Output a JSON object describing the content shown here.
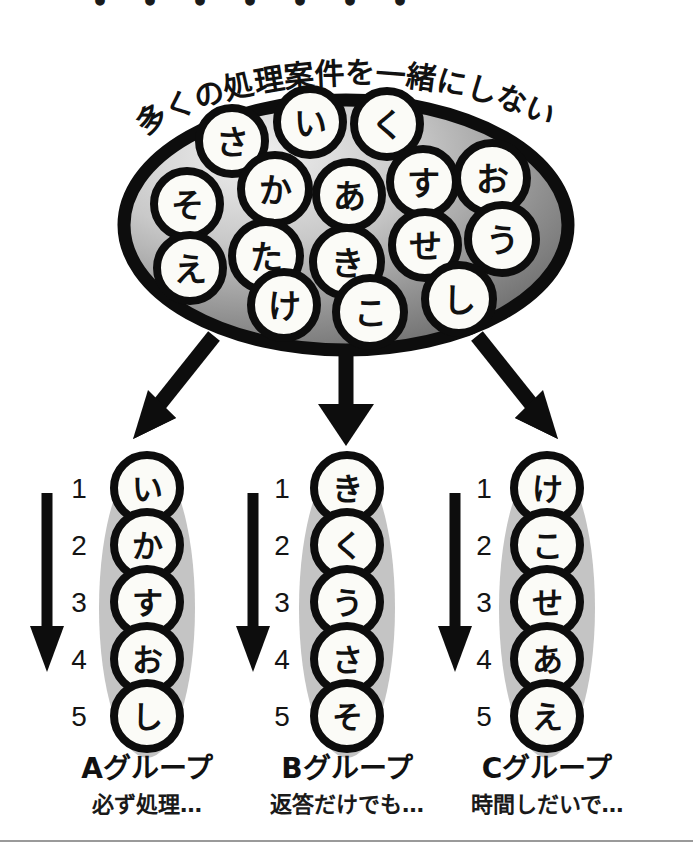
{
  "figure": {
    "headline_curved": "多くの処理案件を一緒にしない",
    "top_cropped_text": "・・・・・・・"
  },
  "pool": {
    "name": "case-pool-ellipse",
    "items": [
      {
        "label": "さ",
        "cx": 232,
        "cy": 141,
        "r": 33
      },
      {
        "label": "い",
        "cx": 310,
        "cy": 122,
        "r": 33
      },
      {
        "label": "く",
        "cx": 387,
        "cy": 124,
        "r": 33
      },
      {
        "label": "そ",
        "cx": 187,
        "cy": 204,
        "r": 33
      },
      {
        "label": "か",
        "cx": 275,
        "cy": 189,
        "r": 34
      },
      {
        "label": "あ",
        "cx": 349,
        "cy": 195,
        "r": 33
      },
      {
        "label": "す",
        "cx": 423,
        "cy": 182,
        "r": 33
      },
      {
        "label": "お",
        "cx": 492,
        "cy": 178,
        "r": 35
      },
      {
        "label": "え",
        "cx": 190,
        "cy": 268,
        "r": 33
      },
      {
        "label": "た",
        "cx": 266,
        "cy": 256,
        "r": 34
      },
      {
        "label": "き",
        "cx": 347,
        "cy": 262,
        "r": 34
      },
      {
        "label": "せ",
        "cx": 425,
        "cy": 245,
        "r": 33
      },
      {
        "label": "う",
        "cx": 502,
        "cy": 239,
        "r": 34
      },
      {
        "label": "け",
        "cx": 284,
        "cy": 305,
        "r": 33
      },
      {
        "label": "こ",
        "cx": 370,
        "cy": 312,
        "r": 34
      },
      {
        "label": "し",
        "cx": 459,
        "cy": 299,
        "r": 34
      }
    ]
  },
  "ranks": [
    "1",
    "2",
    "3",
    "4",
    "5"
  ],
  "groups": [
    {
      "id": "A",
      "title": "Aグループ",
      "subtitle": "必ず処理…",
      "items": [
        "い",
        "か",
        "す",
        "お",
        "し"
      ]
    },
    {
      "id": "B",
      "title": "Bグループ",
      "subtitle": "返答だけでも…",
      "items": [
        "き",
        "く",
        "う",
        "さ",
        "そ"
      ]
    },
    {
      "id": "C",
      "title": "Cグループ",
      "subtitle": "時間しだいで…",
      "items": [
        "け",
        "こ",
        "せ",
        "あ",
        "え"
      ]
    }
  ],
  "colors": {
    "ink": "#111111",
    "paper": "#ffffff",
    "pool_fill_light": "#e8e8e8",
    "pool_fill_dark": "#6e6e6e",
    "lozenge_gray": "#c4c4c4",
    "rule": "#9a9a9a"
  }
}
